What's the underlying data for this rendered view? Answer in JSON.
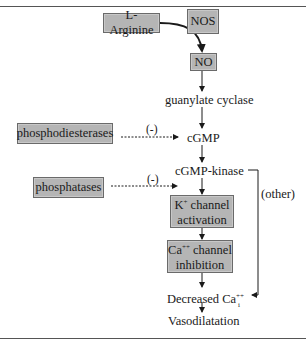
{
  "diagram": {
    "nodes": {
      "l_arginine": "L-Arginine",
      "nos": "NOS",
      "no": "NO",
      "guanylate_cyclase": "guanylate cyclase",
      "phosphodiesterases": "phosphodiesterases",
      "cgmp": "cGMP",
      "cgmp_kinase": "cGMP-kinase",
      "phosphatases": "phosphatases",
      "k_channel_line1_base": "K",
      "k_channel_line1_sup": "+",
      "k_channel_line1_rest": " channel",
      "k_channel_line2": "activation",
      "ca_channel_line1_base": "Ca",
      "ca_channel_line1_sup": "++",
      "ca_channel_line1_rest": " channel",
      "ca_channel_line2": "inhibition",
      "decreased_ca_base": "Decreased Ca",
      "decreased_ca_sup": "++",
      "decreased_ca_sub": "i",
      "vasodilatation": "Vasodilatation"
    },
    "labels": {
      "inhibit_pde": "(-)",
      "inhibit_phosphatases": "(-)",
      "other": "(other)"
    },
    "colors": {
      "box_fill": "#b5b5b5",
      "box_border": "#6a6a6a",
      "line": "#1a1a1a"
    }
  }
}
